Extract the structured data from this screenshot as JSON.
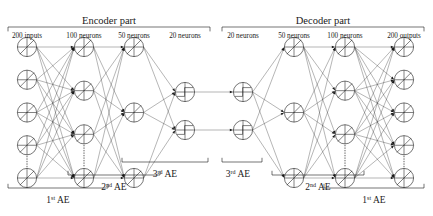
{
  "diagram": {
    "parts": [
      {
        "name": "encoder",
        "label": "Encoder part",
        "x0": 8,
        "x1": 210
      },
      {
        "name": "decoder",
        "label": "Decoder part",
        "x0": 222,
        "x1": 424
      }
    ],
    "layers": [
      {
        "id": "L1",
        "label": "200 inputs",
        "size": 200,
        "nodes": 5,
        "cx": 27,
        "glyph": "cross-slash"
      },
      {
        "id": "L2",
        "label": "100 neurons",
        "size": 100,
        "nodes": 4,
        "cx": 84,
        "glyph": "cross-slash"
      },
      {
        "id": "L3",
        "label": "50 neurons",
        "size": 50,
        "nodes": 3,
        "cx": 134,
        "glyph": "cross-slash"
      },
      {
        "id": "L4",
        "label": "20 neurons",
        "size": 20,
        "nodes": 2,
        "cx": 185,
        "glyph": "cross-step"
      },
      {
        "id": "R1",
        "label": "20 neurons",
        "size": 20,
        "nodes": 2,
        "cx": 243,
        "glyph": "cross-step"
      },
      {
        "id": "R2",
        "label": "50 neurons",
        "size": 50,
        "nodes": 3,
        "cx": 294,
        "glyph": "cross-slash"
      },
      {
        "id": "R3",
        "label": "100 neurons",
        "size": 100,
        "nodes": 4,
        "cx": 345,
        "glyph": "cross-slash"
      },
      {
        "id": "R4",
        "label": "200 outputs",
        "size": 200,
        "nodes": 5,
        "cx": 404,
        "glyph": "cross-slash"
      }
    ],
    "ae_brackets": [
      {
        "name": "encoder-1st-ae",
        "label": "1",
        "sup": "st",
        "suffix": " AE",
        "x0": 8,
        "x1": 108,
        "y": 188,
        "ty": 203
      },
      {
        "name": "encoder-2nd-ae",
        "label": "2",
        "sup": "nd",
        "suffix": " AE",
        "x0": 68,
        "x1": 160,
        "y": 175,
        "ty": 190
      },
      {
        "name": "encoder-3rd-ae",
        "label": "3",
        "sup": "rd",
        "suffix": " AE",
        "x0": 122,
        "x1": 208,
        "y": 162,
        "ty": 177
      },
      {
        "name": "decoder-3rd-ae",
        "label": "3",
        "sup": "rd",
        "suffix": " AE",
        "x0": 222,
        "x1": 222,
        "y": 162,
        "ty": 177
      },
      {
        "name": "decoder-2nd-ae",
        "label": "2",
        "sup": "nd",
        "suffix": " AE",
        "x0": 272,
        "x1": 364,
        "y": 175,
        "ty": 190
      },
      {
        "name": "decoder-1st-ae",
        "label": "1",
        "sup": "st",
        "suffix": " AE",
        "x0": 324,
        "x1": 424,
        "y": 188,
        "ty": 203
      }
    ],
    "notes": {
      "node_symbol": "summation-circle-with-activation",
      "ellipsis": "vertical-dots-indicate-omitted-neurons"
    }
  },
  "colors": {
    "ink": "#1a1a1a",
    "edge": "#2b2b2b",
    "background": "#ffffff"
  }
}
